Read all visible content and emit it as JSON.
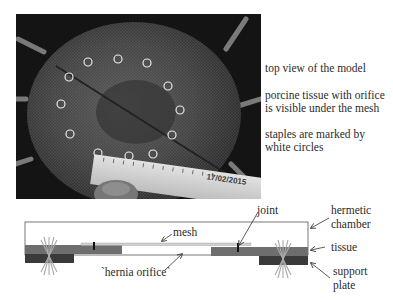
{
  "photo": {
    "description": "top view of porcine tissue under mesh with staples marked",
    "date_stamp": "17/02/2015",
    "staple_marker_color": "#e8e8e8",
    "staple_count": 13
  },
  "captions": [
    "top view of the model",
    "porcine tissue with orifice is visible under the mesh",
    "staples are marked by white circles"
  ],
  "diagram": {
    "labels": {
      "joint": "joint",
      "mesh": "mesh",
      "hernia_orifice": "`hernia orifice`",
      "hermetic_chamber_1": "hermetic",
      "hermetic_chamber_2": "chamber",
      "tissue": "tissue",
      "support_plate_1": "support",
      "support_plate_2": "plate"
    },
    "colors": {
      "tissue": "#6e6e6e",
      "support_plate": "#3a3a3a",
      "mesh": "#cfcfcf",
      "chamber_outline": "#555555"
    }
  }
}
